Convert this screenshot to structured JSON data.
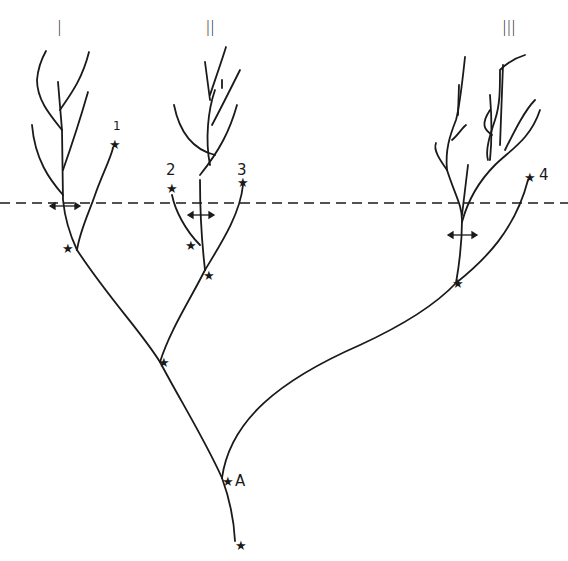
{
  "diagram": {
    "type": "phylogenetic-tree",
    "colors": {
      "line": "#1a1a1a",
      "background": "#ffffff"
    },
    "clades": [
      {
        "id": "I",
        "label": "I"
      },
      {
        "id": "II",
        "label": "II"
      },
      {
        "id": "III",
        "label": "III"
      }
    ],
    "tip_markers": [
      {
        "label": "1"
      },
      {
        "label": "2"
      },
      {
        "label": "3"
      },
      {
        "label": "4"
      }
    ],
    "nodes": {
      "root_star": "★",
      "named_node": {
        "label": "A"
      }
    },
    "reference_line": {
      "style": "dashed",
      "orientation": "horizontal"
    },
    "arrows": {
      "style": "double-headed",
      "count": 3
    }
  }
}
